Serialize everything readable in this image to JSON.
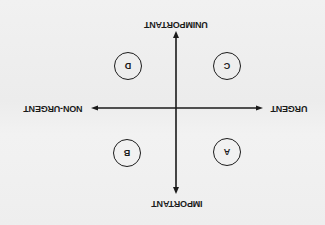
{
  "diagram": {
    "title": "",
    "orientation": "rotated 180 degrees (upside down)",
    "axes": {
      "vertical": {
        "top_label": "IMPORTANT",
        "bottom_label": "UNIMPORTANT"
      },
      "horizontal": {
        "left_label": "URGENT",
        "right_label": "NON-URGENT"
      }
    },
    "quadrants": [
      {
        "letter": "A",
        "position": "urgent-important"
      },
      {
        "letter": "B",
        "position": "non-urgent-important"
      },
      {
        "letter": "C",
        "position": "urgent-unimportant"
      },
      {
        "letter": "D",
        "position": "non-urgent-unimportant"
      }
    ],
    "colors": {
      "ink": "#1a1a1a",
      "paper": "#efefef"
    }
  }
}
